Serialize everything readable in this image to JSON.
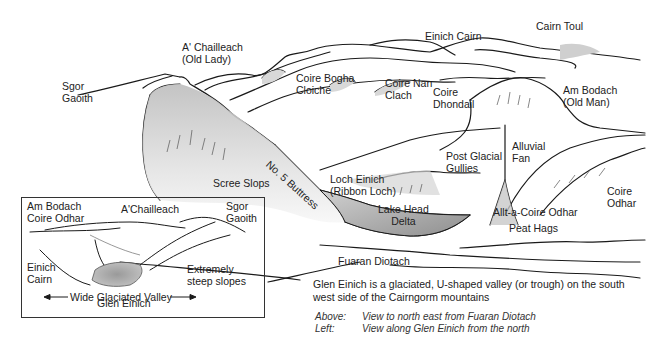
{
  "main_view": {
    "labels": {
      "sgor_gaoith": [
        "Sgor",
        "Gaoith"
      ],
      "a_chailleach": [
        "A' Chailleach",
        "(Old Lady)"
      ],
      "einich_cairn": "Einich Cairn",
      "cairn_toul": "Cairn Toul",
      "coire_bogha_cloiche": [
        "Coire Bogha",
        "Cloiche"
      ],
      "coire_nan_clach": [
        "Coire Nan",
        "Clach"
      ],
      "coire_dhondail": [
        "Coire",
        "Dhondail"
      ],
      "am_bodach": [
        "Am Bodach",
        "(Old Man)"
      ],
      "no5_buttress": "No. 5 Buttress",
      "scree_slops": "Scree Slops",
      "loch_einich": [
        "Loch Einich",
        "(Ribbon Loch)"
      ],
      "lake_head_delta": [
        "Lake Head",
        "Delta"
      ],
      "post_glacial_gullies": [
        "Post Glacial",
        "Gullies"
      ],
      "alluvial_fan": [
        "Alluvial",
        "Fan"
      ],
      "coire_odhar": [
        "Coire",
        "Odhar"
      ],
      "allt_a_coire_odhar": "Allt-a-Coire Odhar",
      "peat_hags": "Peat Hags",
      "fuaran_diotach": "Fuaran Diotach"
    }
  },
  "inset_view": {
    "labels": {
      "am_bodach_coire_odhar": [
        "Am Bodach",
        "Coire Odhar"
      ],
      "a_chailleach": "A'Chailleach",
      "sgor_gaoith": [
        "Sgor",
        "Gaoith"
      ],
      "einich_cairn": [
        "Einich",
        "Cairn"
      ],
      "extremely_steep_slopes": [
        "Extremely",
        "steep slopes"
      ],
      "glen_einich": "Glen Einich",
      "wide_glaciated_valley": "Wide Glaciated Valley"
    }
  },
  "caption": {
    "text": "Glen Einich is a glaciated, U-shaped valley (or trough) on the south west side of the Cairngorm mountains",
    "views": [
      {
        "key": "Above:",
        "value": "View to north east from Fuaran Diotach"
      },
      {
        "key": "Left:",
        "value": "View along Glen Einich from the north"
      }
    ]
  },
  "colors": {
    "line": "#1a1a1a",
    "shade_light": "#e6e6e6",
    "shade_mid": "#c9c9c9",
    "water": "#a9a9a9"
  }
}
